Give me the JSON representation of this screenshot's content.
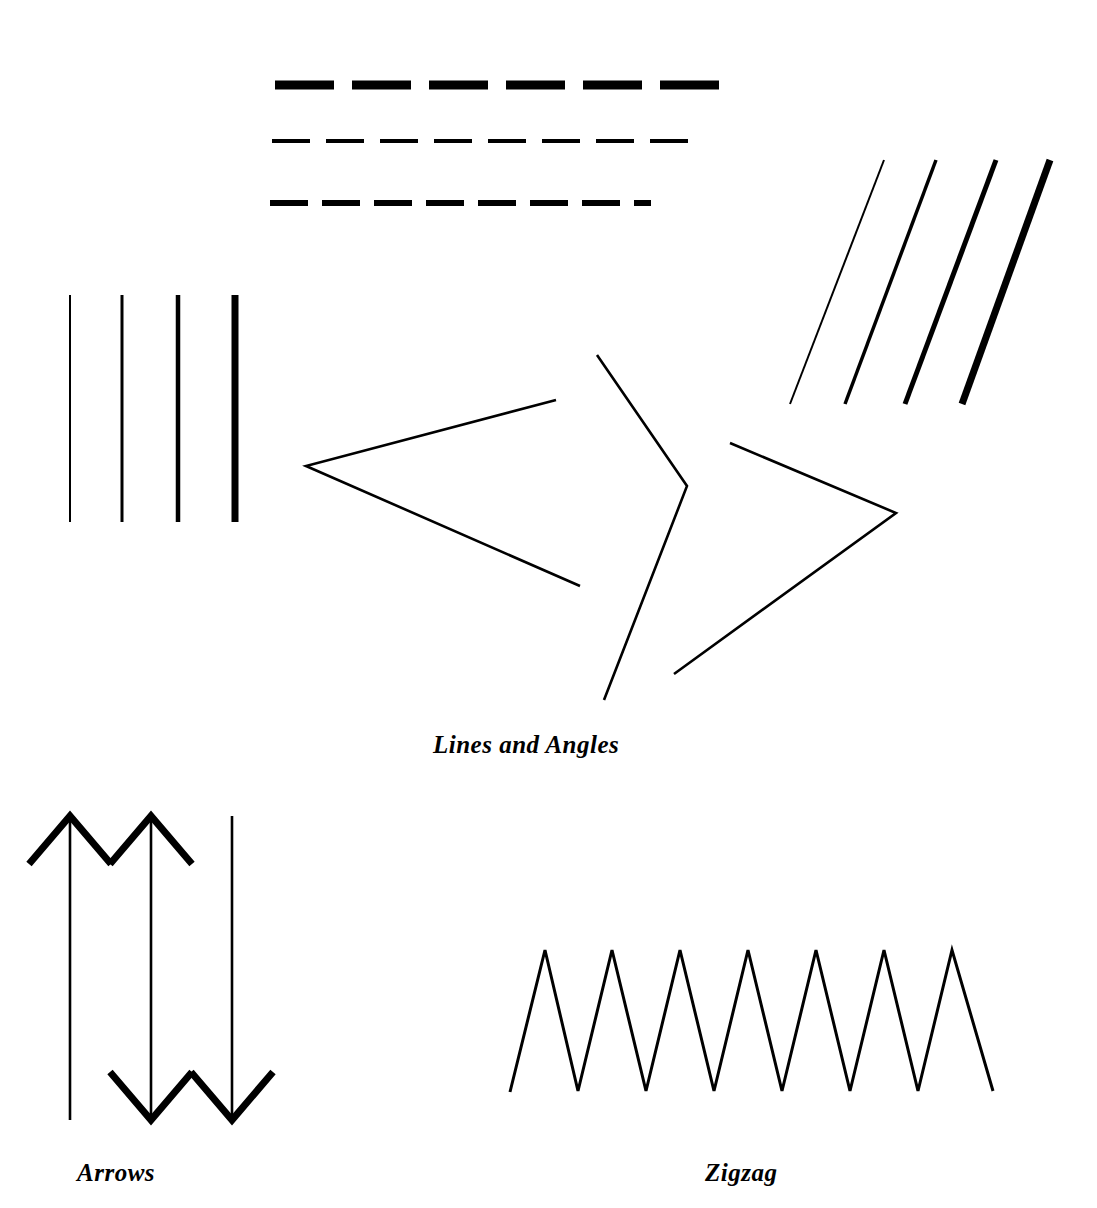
{
  "page": {
    "background_color": "#ffffff",
    "ink_color": "#000000",
    "width": 1097,
    "height": 1208
  },
  "captions": {
    "lines_and_angles": "Lines and Angles",
    "arrows": "Arrows",
    "zigzag": "Zigzag"
  },
  "figure": {
    "title": "Lines and Angles",
    "dashed_lines": {
      "group_name": "dashed-lines-group",
      "rows": [
        {
          "name": "thick-dashed-line",
          "y": 85,
          "x_start": 275,
          "x_end": 733,
          "stroke_width": 9,
          "dash": 59,
          "gap": 18
        },
        {
          "name": "thin-dashed-line",
          "y": 141,
          "x_start": 272,
          "x_end": 690,
          "stroke_width": 4,
          "dash": 38,
          "gap": 16
        },
        {
          "name": "medium-dashed-line",
          "y": 203,
          "x_start": 270,
          "x_end": 651,
          "stroke_width": 6,
          "dash": 38,
          "gap": 14
        }
      ]
    },
    "vertical_lines": {
      "group_name": "vertical-lines-group",
      "y_top": 295,
      "y_bottom": 522,
      "lines": [
        {
          "name": "vertical-line-hairline",
          "x": 70,
          "stroke_width": 2
        },
        {
          "name": "vertical-line-thin",
          "x": 122,
          "stroke_width": 3
        },
        {
          "name": "vertical-line-medium",
          "x": 178,
          "stroke_width": 4.5
        },
        {
          "name": "vertical-line-thick",
          "x": 235,
          "stroke_width": 7
        }
      ]
    },
    "diagonal_lines": {
      "group_name": "diagonal-lines-group",
      "y_top": 160,
      "y_bottom": 404,
      "lines": [
        {
          "name": "diagonal-line-hairline",
          "x_top": 884,
          "x_bottom": 790,
          "stroke_width": 2
        },
        {
          "name": "diagonal-line-thin",
          "x_top": 936,
          "x_bottom": 845,
          "stroke_width": 3.5
        },
        {
          "name": "diagonal-line-medium",
          "x_top": 996,
          "x_bottom": 905,
          "stroke_width": 5
        },
        {
          "name": "diagonal-line-thick",
          "x_top": 1050,
          "x_bottom": 962,
          "stroke_width": 7
        }
      ]
    },
    "angles": {
      "group_name": "angles-group",
      "stroke_width": 2.6,
      "items": [
        {
          "name": "angle-open-right",
          "arm_a": {
            "x": 556,
            "y": 400
          },
          "vertex": {
            "x": 306,
            "y": 466
          },
          "arm_b": {
            "x": 580,
            "y": 586
          }
        },
        {
          "name": "angle-open-left-upper",
          "arm_a": {
            "x": 597,
            "y": 355
          },
          "vertex": {
            "x": 687,
            "y": 486
          },
          "arm_b": {
            "x": 604,
            "y": 700
          }
        },
        {
          "name": "angle-open-left-lower",
          "arm_a": {
            "x": 730,
            "y": 443
          },
          "vertex": {
            "x": 896,
            "y": 513
          },
          "arm_b": {
            "x": 674,
            "y": 674
          }
        }
      ]
    },
    "arrows": {
      "group_name": "arrows-group",
      "shaft_stroke_width": 2.6,
      "head_stroke_width": 7,
      "head_half_width": 41,
      "head_height": 48,
      "items": [
        {
          "name": "arrow-up",
          "x": 70,
          "y_top": 816,
          "y_bottom": 1120,
          "head_top": true,
          "head_bottom": false
        },
        {
          "name": "arrow-double-headed",
          "x": 151,
          "y_top": 816,
          "y_bottom": 1120,
          "head_top": true,
          "head_bottom": true
        },
        {
          "name": "arrow-down",
          "x": 232,
          "y_top": 816,
          "y_bottom": 1120,
          "head_top": false,
          "head_bottom": true
        }
      ]
    },
    "zigzag": {
      "group_name": "zigzag-group",
      "stroke_width": 3,
      "peak_count": 7,
      "peak_y": 950,
      "valley_y": 1092,
      "x_start": 510,
      "x_end": 993,
      "points": "510,1092 545,950 578,1091 612,950 646,1091 680,950 714,1091 748,950 782,1091 816,950 850,1091 884,950 918,1091 952,950 993,1091"
    }
  }
}
